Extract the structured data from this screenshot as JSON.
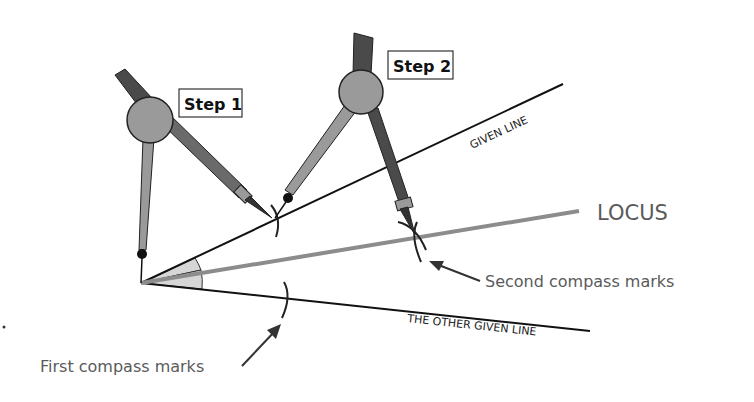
{
  "diagram": {
    "steps": [
      {
        "label": "Step 1"
      },
      {
        "label": "Step 2"
      }
    ],
    "labels": {
      "given_line": "GIVEN LINE",
      "other_given_line": "THE OTHER GIVEN LINE",
      "locus": "LOCUS",
      "first_marks": "First compass marks",
      "second_marks": "Second compass marks"
    },
    "geometry": {
      "vertex": [
        141,
        283
      ],
      "given_line_end": [
        563,
        84
      ],
      "locus_end": [
        579,
        211
      ],
      "other_line_end": [
        590,
        331
      ]
    },
    "colors": {
      "line": "#111111",
      "locus": "#8c8c8c",
      "angle_fill": "#d6d6d6",
      "compass_light": "#9a9a9a",
      "compass_dark": "#4a4a4a",
      "hinge": "#9a9a9a",
      "label_text": "#5a5a5a"
    }
  }
}
